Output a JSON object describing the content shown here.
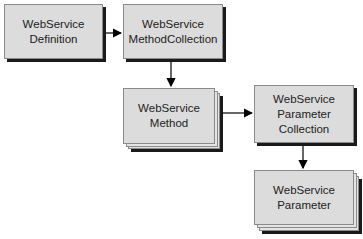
{
  "diagram": {
    "nodes": [
      {
        "id": "definition",
        "lines": [
          "WebService",
          "Definition"
        ],
        "stacked": false
      },
      {
        "id": "method_collection",
        "lines": [
          "WebService",
          "MethodCollection"
        ],
        "stacked": false
      },
      {
        "id": "method",
        "lines": [
          "WebService",
          "Method"
        ],
        "stacked": true
      },
      {
        "id": "parameter_collection",
        "lines": [
          "WebService",
          "Parameter",
          "Collection"
        ],
        "stacked": false
      },
      {
        "id": "parameter",
        "lines": [
          "WebService",
          "Parameter"
        ],
        "stacked": true
      }
    ],
    "edges": [
      {
        "from": "definition",
        "to": "method_collection"
      },
      {
        "from": "method_collection",
        "to": "method"
      },
      {
        "from": "method",
        "to": "parameter_collection"
      },
      {
        "from": "parameter_collection",
        "to": "parameter"
      }
    ],
    "colors": {
      "box_fill": "#dcdcdc",
      "shadow": "#1a1a1a",
      "arrow": "#000000"
    }
  }
}
